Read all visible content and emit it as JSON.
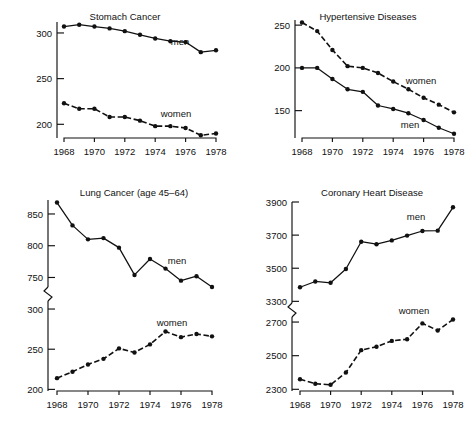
{
  "figure": {
    "panel_count": 4,
    "line_color": "#111111",
    "background": "#ffffff"
  },
  "panels": {
    "stomach": {
      "title": "Stomach Cancer",
      "series_labels": {
        "men": "men",
        "women": "women"
      },
      "xticks": [
        "1968",
        "1970",
        "1972",
        "1974",
        "1976",
        "1978"
      ],
      "yticks": [
        "200",
        "250",
        "300"
      ]
    },
    "hypertensive": {
      "title": "Hypertensive Diseases",
      "series_labels": {
        "men": "men",
        "women": "women"
      },
      "xticks": [
        "1968",
        "1970",
        "1972",
        "1974",
        "1976",
        "1978"
      ],
      "yticks": [
        "150",
        "200",
        "250"
      ]
    },
    "lung": {
      "title": "Lung Cancer (age 45–64)",
      "series_labels": {
        "men": "men",
        "women": "women"
      },
      "xticks": [
        "1968",
        "1970",
        "1972",
        "1974",
        "1976",
        "1978"
      ],
      "yticks_upper": [
        "750",
        "800",
        "850"
      ],
      "yticks_lower": [
        "200",
        "250",
        "300"
      ]
    },
    "coronary": {
      "title": "Coronary Heart Disease",
      "series_labels": {
        "men": "men",
        "women": "women"
      },
      "xticks": [
        "1968",
        "1970",
        "1972",
        "1974",
        "1976",
        "1978"
      ],
      "yticks_upper": [
        "3300",
        "3500",
        "3700",
        "3900"
      ],
      "yticks_lower": [
        "2300",
        "2500",
        "2700"
      ]
    }
  },
  "chart_data": [
    {
      "id": "stomach",
      "type": "line",
      "title": "Stomach Cancer",
      "xlabel": "",
      "ylabel": "",
      "x": [
        1968,
        1969,
        1970,
        1971,
        1972,
        1973,
        1974,
        1975,
        1976,
        1977,
        1978
      ],
      "xlim": [
        1968,
        1978
      ],
      "ylim": [
        185,
        312
      ],
      "yticks": [
        200,
        250,
        300
      ],
      "xticks": [
        1968,
        1970,
        1972,
        1974,
        1976,
        1978
      ],
      "grid": false,
      "legend_position": "inline-annotation",
      "axis_break": false,
      "series": [
        {
          "name": "men",
          "style": "solid",
          "values": [
            307,
            309,
            307,
            305,
            302,
            298,
            294,
            291,
            290,
            279,
            281
          ]
        },
        {
          "name": "women",
          "style": "dashed",
          "values": [
            223,
            217,
            217,
            208,
            208,
            204,
            198,
            198,
            196,
            188,
            190
          ]
        }
      ]
    },
    {
      "id": "hypertensive",
      "type": "line",
      "title": "Hypertensive Diseases",
      "xlabel": "",
      "ylabel": "",
      "x": [
        1968,
        1969,
        1970,
        1971,
        1972,
        1973,
        1974,
        1975,
        1976,
        1977,
        1978
      ],
      "xlim": [
        1968,
        1978
      ],
      "ylim": [
        118,
        256
      ],
      "yticks": [
        150,
        200,
        250
      ],
      "xticks": [
        1968,
        1970,
        1972,
        1974,
        1976,
        1978
      ],
      "grid": false,
      "legend_position": "inline-annotation",
      "axis_break": false,
      "series": [
        {
          "name": "women",
          "style": "dashed",
          "values": [
            253,
            243,
            221,
            202,
            200,
            194,
            184,
            175,
            165,
            157,
            148
          ]
        },
        {
          "name": "men",
          "style": "solid",
          "values": [
            200,
            200,
            187,
            175,
            172,
            156,
            152,
            147,
            139,
            130,
            123
          ]
        }
      ]
    },
    {
      "id": "lung",
      "type": "line",
      "title": "Lung Cancer (age 45–64)",
      "xlabel": "",
      "ylabel": "",
      "x": [
        1968,
        1969,
        1970,
        1971,
        1972,
        1973,
        1974,
        1975,
        1976,
        1977,
        1978
      ],
      "xticks": [
        1968,
        1970,
        1972,
        1974,
        1976,
        1978
      ],
      "grid": false,
      "legend_position": "inline-annotation",
      "axis_break": true,
      "axis_break_note": "y-axis broken between 300 and 750",
      "yticks_upper": [
        750,
        800,
        850
      ],
      "yticks_lower": [
        200,
        250,
        300
      ],
      "ylim_upper": [
        735,
        872
      ],
      "ylim_lower": [
        198,
        310
      ],
      "series": [
        {
          "name": "men",
          "style": "solid",
          "segment": "upper",
          "values": [
            868,
            832,
            810,
            812,
            797,
            754,
            779,
            764,
            745,
            752,
            735
          ]
        },
        {
          "name": "women",
          "style": "dashed",
          "segment": "lower",
          "values": [
            214,
            222,
            231,
            238,
            251,
            246,
            256,
            272,
            265,
            269,
            266
          ]
        }
      ]
    },
    {
      "id": "coronary",
      "type": "line",
      "title": "Coronary Heart Disease",
      "xlabel": "",
      "ylabel": "",
      "x": [
        1968,
        1969,
        1970,
        1971,
        1972,
        1973,
        1974,
        1975,
        1976,
        1977,
        1978
      ],
      "xticks": [
        1968,
        1970,
        1972,
        1974,
        1976,
        1978
      ],
      "grid": false,
      "legend_position": "inline-annotation",
      "axis_break": true,
      "axis_break_note": "y-axis broken between 2700 and 3300",
      "yticks_upper": [
        3300,
        3500,
        3700,
        3900
      ],
      "yticks_lower": [
        2300,
        2500,
        2700
      ],
      "ylim_upper": [
        3290,
        3900
      ],
      "ylim_lower": [
        2290,
        2730
      ],
      "series": [
        {
          "name": "men",
          "style": "solid",
          "segment": "upper",
          "values": [
            3385,
            3420,
            3412,
            3495,
            3660,
            3645,
            3668,
            3697,
            3725,
            3727,
            3868
          ]
        },
        {
          "name": "women",
          "style": "dashed",
          "segment": "lower",
          "values": [
            2360,
            2333,
            2327,
            2400,
            2533,
            2553,
            2588,
            2598,
            2692,
            2650,
            2715
          ]
        }
      ]
    }
  ]
}
